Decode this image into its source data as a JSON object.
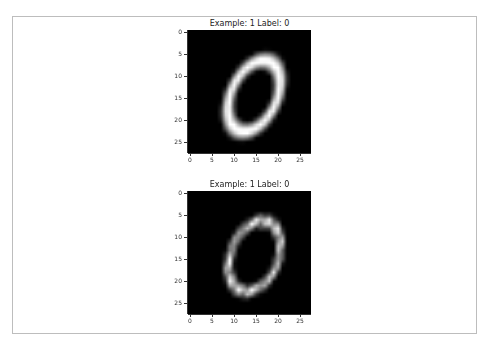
{
  "chart_data": [
    {
      "type": "heatmap",
      "title": "Example: 1  Label: 0",
      "xlabel": "",
      "ylabel": "",
      "xlim": [
        -0.5,
        27.5
      ],
      "ylim": [
        27.5,
        -0.5
      ],
      "xticks": [
        0,
        5,
        10,
        15,
        20,
        25
      ],
      "yticks": [
        0,
        5,
        10,
        15,
        20,
        25
      ],
      "colormap": "gray",
      "image_size": [
        28,
        28
      ],
      "description": "Original MNIST digit 0, smooth tilted oval stroke",
      "strokes": {
        "center": [
          14.5,
          14.5
        ],
        "rx": 5.2,
        "ry": 8.6,
        "angle_deg": 25,
        "thickness": 1.6
      }
    },
    {
      "type": "heatmap",
      "title": "Example: 1  Label: 0",
      "xlabel": "",
      "ylabel": "",
      "xlim": [
        -0.5,
        27.5
      ],
      "ylim": [
        27.5,
        -0.5
      ],
      "xticks": [
        0,
        5,
        10,
        15,
        20,
        25
      ],
      "yticks": [
        0,
        5,
        10,
        15,
        20,
        25
      ],
      "colormap": "gray",
      "image_size": [
        28,
        28
      ],
      "description": "Reconstructed/perturbed MNIST digit 0, jagged tilted oval stroke with notch at top",
      "strokes": {
        "center": [
          14.6,
          14.3
        ],
        "rx": 5.4,
        "ry": 8.4,
        "angle_deg": 22,
        "thickness": 1.3
      }
    }
  ],
  "panels": [
    {
      "title": "Example: 1  Label: 0"
    },
    {
      "title": "Example: 1  Label: 0"
    }
  ],
  "ticks": [
    "0",
    "5",
    "10",
    "15",
    "20",
    "25"
  ]
}
